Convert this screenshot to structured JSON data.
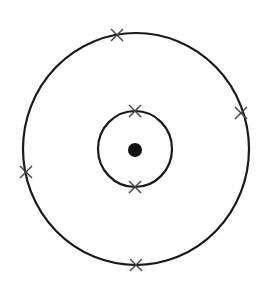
{
  "diagram": {
    "type": "bohr-atom-model",
    "background": "#ffffff",
    "stroke_color": "#1a1a1a",
    "nucleus": {
      "cx": 135,
      "cy": 150,
      "r": 7,
      "fill": "#111111"
    },
    "shells": [
      {
        "name": "inner-shell",
        "cx": 135,
        "cy": 149,
        "rx": 37,
        "ry": 38,
        "electrons": [
          {
            "x": 135,
            "y": 111
          },
          {
            "x": 135,
            "y": 187
          }
        ]
      },
      {
        "name": "outer-shell",
        "cx": 136,
        "cy": 149,
        "rx": 113,
        "ry": 116,
        "electrons": [
          {
            "x": 117,
            "y": 35
          },
          {
            "x": 241,
            "y": 113
          },
          {
            "x": 26,
            "y": 172
          },
          {
            "x": 136,
            "y": 265
          }
        ]
      }
    ],
    "electron_marker": "cross",
    "electron_count": 6,
    "shell_configuration": "2,4"
  }
}
